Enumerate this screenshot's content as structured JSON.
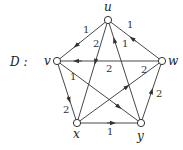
{
  "graph": {
    "title": "D :",
    "nodes": [
      {
        "id": "u",
        "label": "u",
        "x": 108,
        "y": 20
      },
      {
        "id": "v",
        "label": "v",
        "x": 57,
        "y": 61
      },
      {
        "id": "w",
        "label": "w",
        "x": 162,
        "y": 61
      },
      {
        "id": "x",
        "label": "x",
        "x": 77,
        "y": 123
      },
      {
        "id": "y",
        "label": "y",
        "x": 141,
        "y": 123
      }
    ],
    "edges": [
      {
        "from": "u",
        "to": "v",
        "weight": "1"
      },
      {
        "from": "w",
        "to": "u",
        "weight": "1"
      },
      {
        "from": "w",
        "to": "v",
        "weight": "2"
      },
      {
        "from": "u",
        "to": "x",
        "weight": "2"
      },
      {
        "from": "y",
        "to": "u",
        "weight": "1"
      },
      {
        "from": "v",
        "to": "x",
        "weight": "2"
      },
      {
        "from": "v",
        "to": "y",
        "weight": "1"
      },
      {
        "from": "x",
        "to": "w",
        "weight": "2"
      },
      {
        "from": "x",
        "to": "y",
        "weight": "1"
      },
      {
        "from": "y",
        "to": "w",
        "weight": "2"
      }
    ]
  }
}
